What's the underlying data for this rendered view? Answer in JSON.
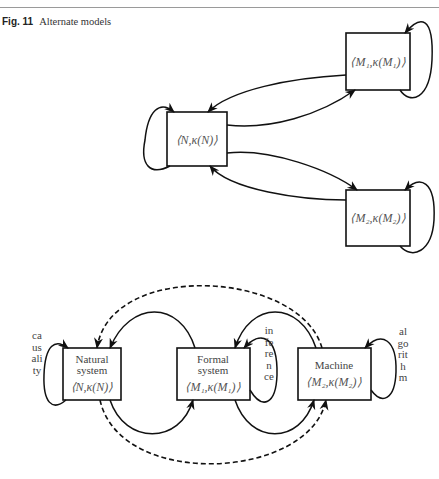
{
  "caption": {
    "label": "Fig. 11",
    "title": "Alternate models"
  },
  "top_diagram": {
    "nodes": [
      {
        "id": "N",
        "text": "⟨N,κ(N)⟩"
      },
      {
        "id": "M1",
        "text": "⟨M₁,κ(M₁)⟩"
      },
      {
        "id": "M2",
        "text": "⟨M₂,κ(M₂)⟩"
      }
    ],
    "edges": [
      "N→M1",
      "M1→N",
      "N→M2",
      "M2→N",
      "N→N",
      "M1→M1",
      "M2→M2"
    ]
  },
  "bottom_diagram": {
    "nodes": [
      {
        "id": "natural",
        "line1": "Natural",
        "line2": "system",
        "math": "⟨N,κ(N)⟩"
      },
      {
        "id": "formal",
        "line1": "Formal",
        "line2": "system",
        "math": "⟨M₁,κ(M₁)⟩"
      },
      {
        "id": "machine",
        "line1": "Machine",
        "math": "⟨M₂,κ(M₂)⟩"
      }
    ],
    "loop_labels": {
      "natural": "causality",
      "formal": "inference",
      "machine": "algorithm"
    },
    "edges": {
      "solid": [
        "natural→formal",
        "formal→natural",
        "formal→machine",
        "machine→formal"
      ],
      "dashed": [
        "machine→natural",
        "natural→machine"
      ],
      "self_loops": [
        "natural",
        "formal",
        "machine"
      ]
    }
  }
}
